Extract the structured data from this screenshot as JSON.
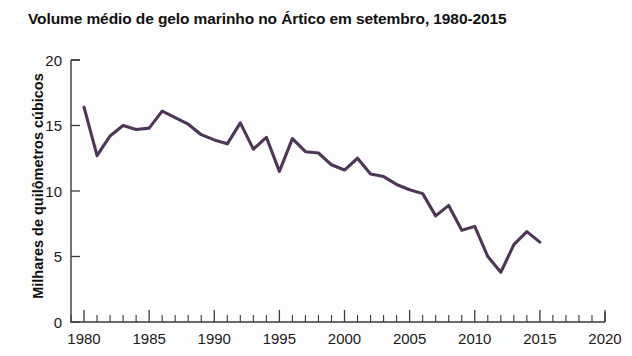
{
  "chart_data": {
    "type": "line",
    "title": "Volume médio de gelo marinho no Ártico em setembro, 1980-2015",
    "xlabel": "",
    "ylabel": "Milhares de quilômetros cúbicos",
    "xlim": [
      1979,
      2020
    ],
    "ylim": [
      0,
      20
    ],
    "xticks": [
      1980,
      1985,
      1990,
      1995,
      2000,
      2005,
      2010,
      2015,
      2020
    ],
    "yticks": [
      0,
      5,
      10,
      15,
      20
    ],
    "xtick_labels": [
      "1980",
      "1985",
      "1990",
      "1995",
      "2000",
      "2005",
      "2010",
      "2015",
      "2020"
    ],
    "ytick_labels": [
      "0",
      "5",
      "10",
      "15",
      "20"
    ],
    "minor_xtick_step": 1,
    "grid": false,
    "legend": null,
    "line_color": "#4d3656",
    "x": [
      1980,
      1981,
      1982,
      1983,
      1984,
      1985,
      1986,
      1987,
      1988,
      1989,
      1990,
      1991,
      1992,
      1993,
      1994,
      1995,
      1996,
      1997,
      1998,
      1999,
      2000,
      2001,
      2002,
      2003,
      2004,
      2005,
      2006,
      2007,
      2008,
      2009,
      2010,
      2011,
      2012,
      2013,
      2014,
      2015
    ],
    "values": [
      16.4,
      12.7,
      14.2,
      15.0,
      14.7,
      14.8,
      16.1,
      15.6,
      15.1,
      14.3,
      13.9,
      13.6,
      15.2,
      13.2,
      14.1,
      11.5,
      14.0,
      13.0,
      12.9,
      12.0,
      11.6,
      12.5,
      11.3,
      11.1,
      10.5,
      10.1,
      9.8,
      8.1,
      8.9,
      7.0,
      7.3,
      5.0,
      3.8,
      5.9,
      6.9,
      6.1
    ]
  }
}
